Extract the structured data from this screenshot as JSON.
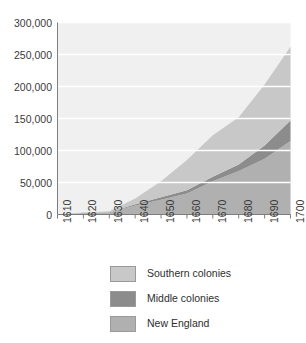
{
  "chart_data": {
    "type": "area",
    "title": "",
    "subtitle": "",
    "xlabel": "",
    "ylabel": "",
    "stacked": true,
    "grid": true,
    "legend_position": "bottom",
    "x": [
      1610,
      1620,
      1630,
      1640,
      1650,
      1660,
      1670,
      1680,
      1690,
      1700
    ],
    "xlim": [
      1610,
      1700
    ],
    "ylim": [
      0,
      300000
    ],
    "yticks": [
      0,
      50000,
      100000,
      150000,
      200000,
      250000,
      300000
    ],
    "ytick_labels": [
      "0",
      "50,000",
      "100,000",
      "150,000",
      "200,000",
      "250,000",
      "300,000"
    ],
    "xtick_labels": [
      "1610",
      "1620",
      "1630",
      "1640",
      "1650",
      "1660",
      "1670",
      "1680",
      "1690",
      "1700"
    ],
    "series": [
      {
        "name": "New England",
        "color": "#b0b0b0",
        "values": [
          0,
          2000,
          3000,
          14000,
          23000,
          33000,
          52000,
          68000,
          87000,
          115000
        ]
      },
      {
        "name": "Middle colonies",
        "color": "#8c8c8c",
        "values": [
          0,
          500,
          500,
          2000,
          4000,
          5000,
          7000,
          10000,
          21000,
          32000
        ]
      },
      {
        "name": "Southern colonies",
        "color": "#c8c8c8",
        "values": [
          0,
          500,
          1500,
          9000,
          25000,
          47000,
          65000,
          74000,
          95000,
          115000
        ]
      }
    ],
    "cumulative_totals": [
      0,
      3000,
      5000,
      25000,
      52000,
      85000,
      124000,
      152000,
      203000,
      262000
    ],
    "plot_background": "#f0f0f0",
    "gridline_color": "#ffffff"
  },
  "legend": {
    "items": [
      {
        "label": "Southern colonies",
        "color": "#c8c8c8"
      },
      {
        "label": "Middle colonies",
        "color": "#8c8c8c"
      },
      {
        "label": "New England",
        "color": "#b0b0b0"
      }
    ]
  }
}
